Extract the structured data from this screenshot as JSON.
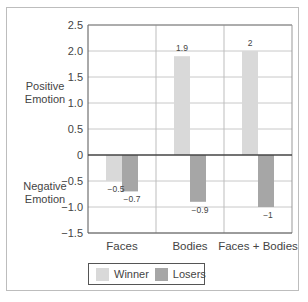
{
  "chart_data": {
    "type": "bar",
    "title": "",
    "xlabel": "",
    "ylabel": "",
    "categories": [
      "Faces",
      "Bodies",
      "Faces + Bodies"
    ],
    "series": [
      {
        "name": "Winner",
        "values": [
          -0.5,
          1.9,
          2
        ],
        "color": "#d9d9d9"
      },
      {
        "name": "Losers",
        "values": [
          -0.7,
          -0.9,
          -1
        ],
        "color": "#a6a6a6"
      }
    ],
    "ylim": [
      -1.5,
      2.5
    ],
    "yticks": [
      "2.5",
      "2.0",
      "1.5",
      "1.0",
      "0.5",
      "0",
      "−0.5",
      "−1.0",
      "−1.5"
    ],
    "ytick_values": [
      2.5,
      2.0,
      1.5,
      1.0,
      0.5,
      0,
      -0.5,
      -1.0,
      -1.5
    ],
    "data_labels": {
      "Winner": [
        "−0.5",
        "1.9",
        "2"
      ],
      "Losers": [
        "−0.7",
        "−0.9",
        "−1"
      ]
    },
    "annotations": [
      "Positive Emotion",
      "Negative Emotion"
    ],
    "grid": true,
    "legend_position": "bottom"
  },
  "labels": {
    "positive_line1": "Positive",
    "positive_line2": "Emotion",
    "negative_line1": "Negative",
    "negative_line2": "Emotion"
  },
  "legend": {
    "winner": "Winner",
    "losers": "Losers",
    "winner_color": "#d9d9d9",
    "losers_color": "#a6a6a6"
  }
}
